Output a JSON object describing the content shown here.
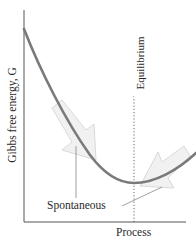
{
  "figure": {
    "y_axis_label": "Gibbs free energy, G",
    "x_axis_label": "Process",
    "equilibrium_label": "Equilibrium",
    "spontaneous_label": "Spontaneous"
  },
  "style": {
    "curve_color": "#7a7a7a",
    "axis_color": "#555555",
    "arrow_fill": "#f0f0f0",
    "arrow_stroke": "#d8d8d8",
    "text_color": "#2a2a2a"
  },
  "diagram": {
    "type": "energy-profile",
    "curve_points_px": [
      [
        24,
        29
      ],
      [
        40,
        66
      ],
      [
        60,
        110
      ],
      [
        80,
        143
      ],
      [
        100,
        165
      ],
      [
        120,
        178
      ],
      [
        134,
        183
      ],
      [
        150,
        182
      ],
      [
        165,
        176
      ],
      [
        180,
        166
      ],
      [
        196,
        153
      ]
    ],
    "minimum_px": [
      134,
      183
    ],
    "arrows": [
      {
        "name": "left-spontaneous-arrow",
        "direction": "down-right"
      },
      {
        "name": "right-spontaneous-arrow",
        "direction": "down-left"
      }
    ]
  }
}
